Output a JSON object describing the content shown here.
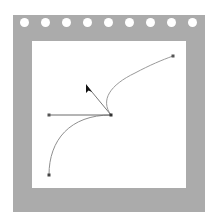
{
  "frame": {
    "color": "#ababab",
    "hole_count": 9,
    "hole_centers_x": [
      25,
      46,
      67,
      88,
      109,
      130,
      151,
      172,
      193
    ]
  },
  "path": {
    "stroke_color": "#8a8a8a",
    "handle_color": "#6a6a6a",
    "point_color": "#444444",
    "anchor": {
      "x": 111,
      "y": 115
    },
    "start_point": {
      "x": 49,
      "y": 175
    },
    "end_point": {
      "x": 173,
      "y": 56
    },
    "handle_left": {
      "x": 49,
      "y": 115
    },
    "handle_up": {
      "x": 87,
      "y": 86
    }
  },
  "cursor": {
    "icon": "arrow-cursor-icon",
    "x": 87,
    "y": 86
  }
}
